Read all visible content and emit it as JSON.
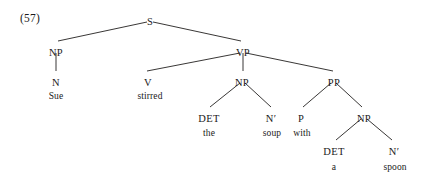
{
  "figure": {
    "example_number": "(57)",
    "sentence": "Sue stirred the soup with a spoon",
    "ink_color": "#23201f",
    "background_color": "#ffffff"
  },
  "chart_data": {
    "type": "diagram",
    "diagram_kind": "syntax-tree",
    "title": "(57)",
    "nodes": [
      {
        "id": "S",
        "label": "S",
        "x": 150,
        "y": 17,
        "kind": "category"
      },
      {
        "id": "NP1",
        "label": "NP",
        "x": 56,
        "y": 48,
        "kind": "category"
      },
      {
        "id": "VP",
        "label": "VP",
        "x": 243,
        "y": 48,
        "kind": "category"
      },
      {
        "id": "N1",
        "label": "N",
        "x": 56,
        "y": 78,
        "kind": "category"
      },
      {
        "id": "V",
        "label": "V",
        "x": 148,
        "y": 78,
        "kind": "category"
      },
      {
        "id": "NP2",
        "label": "NP",
        "x": 242,
        "y": 78,
        "kind": "category"
      },
      {
        "id": "PP",
        "label": "PP",
        "x": 334,
        "y": 78,
        "kind": "category"
      },
      {
        "id": "DET1",
        "label": "DET",
        "x": 209,
        "y": 114,
        "kind": "category"
      },
      {
        "id": "NBAR1",
        "label": "N′",
        "x": 271,
        "y": 114,
        "kind": "category"
      },
      {
        "id": "P",
        "label": "P",
        "x": 301,
        "y": 114,
        "kind": "category"
      },
      {
        "id": "NP3",
        "label": "NP",
        "x": 364,
        "y": 114,
        "kind": "category"
      },
      {
        "id": "DET2",
        "label": "DET",
        "x": 334,
        "y": 147,
        "kind": "category"
      },
      {
        "id": "NBAR2",
        "label": "N′",
        "x": 394,
        "y": 147,
        "kind": "category"
      }
    ],
    "leaves": [
      {
        "id": "w-sue",
        "label": "Sue",
        "x": 56,
        "y": 92,
        "parent": "N1"
      },
      {
        "id": "w-stirred",
        "label": "stirred",
        "x": 150,
        "y": 92,
        "parent": "V"
      },
      {
        "id": "w-the",
        "label": "the",
        "x": 209,
        "y": 129,
        "parent": "DET1"
      },
      {
        "id": "w-soup",
        "label": "soup",
        "x": 272,
        "y": 129,
        "parent": "NBAR1"
      },
      {
        "id": "w-with",
        "label": "with",
        "x": 302,
        "y": 129,
        "parent": "P"
      },
      {
        "id": "w-a",
        "label": "a",
        "x": 334,
        "y": 163,
        "parent": "DET2"
      },
      {
        "id": "w-spoon",
        "label": "spoon",
        "x": 395,
        "y": 163,
        "parent": "NBAR2"
      }
    ],
    "edges": [
      {
        "from": "S",
        "to": "NP1",
        "x1": 147,
        "y1": 22,
        "x2": 58,
        "y2": 41
      },
      {
        "from": "S",
        "to": "VP",
        "x1": 153,
        "y1": 22,
        "x2": 241,
        "y2": 41
      },
      {
        "from": "NP1",
        "to": "N1",
        "x1": 56,
        "y1": 53,
        "x2": 56,
        "y2": 71
      },
      {
        "from": "VP",
        "to": "V",
        "x1": 240,
        "y1": 53,
        "x2": 147,
        "y2": 71
      },
      {
        "from": "VP",
        "to": "NP2",
        "x1": 243,
        "y1": 53,
        "x2": 243,
        "y2": 71
      },
      {
        "from": "VP",
        "to": "PP",
        "x1": 246,
        "y1": 53,
        "x2": 333,
        "y2": 71
      },
      {
        "from": "NP2",
        "to": "DET1",
        "x1": 240,
        "y1": 83,
        "x2": 210,
        "y2": 107
      },
      {
        "from": "NP2",
        "to": "NBAR1",
        "x1": 245,
        "y1": 83,
        "x2": 271,
        "y2": 107
      },
      {
        "from": "PP",
        "to": "P",
        "x1": 331,
        "y1": 83,
        "x2": 303,
        "y2": 107
      },
      {
        "from": "PP",
        "to": "NP3",
        "x1": 336,
        "y1": 83,
        "x2": 362,
        "y2": 107
      },
      {
        "from": "NP3",
        "to": "DET2",
        "x1": 361,
        "y1": 119,
        "x2": 336,
        "y2": 140
      },
      {
        "from": "NP3",
        "to": "NBAR2",
        "x1": 367,
        "y1": 119,
        "x2": 392,
        "y2": 140
      }
    ]
  }
}
